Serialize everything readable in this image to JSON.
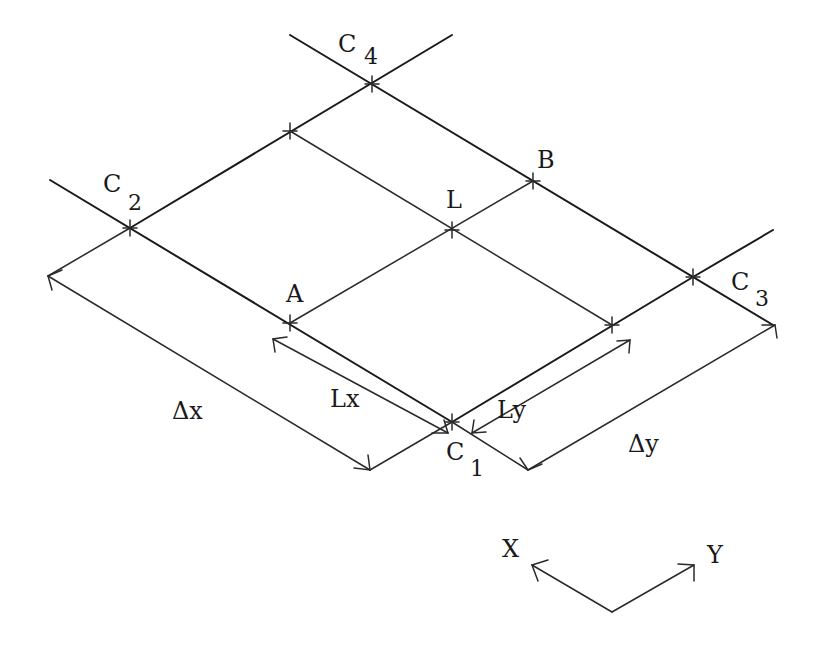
{
  "diagram": {
    "type": "isometric-grid-cell",
    "stroke_color": "#1a1a1a",
    "background": "#ffffff",
    "corners": [
      {
        "id": "C1",
        "label": "C",
        "subscript": "1",
        "x": 452,
        "y": 422
      },
      {
        "id": "C2",
        "label": "C",
        "subscript": "2",
        "x": 130,
        "y": 228
      },
      {
        "id": "C3",
        "label": "C",
        "subscript": "3",
        "x": 693,
        "y": 277
      },
      {
        "id": "C4",
        "label": "C",
        "subscript": "4",
        "x": 372,
        "y": 84
      }
    ],
    "points": [
      {
        "id": "A",
        "label": "A",
        "x": 290,
        "y": 323
      },
      {
        "id": "B",
        "label": "B",
        "x": 533,
        "y": 181
      },
      {
        "id": "L",
        "label": "L",
        "x": 452,
        "y": 230
      }
    ],
    "dimensions": [
      {
        "id": "dx",
        "label": "Δx"
      },
      {
        "id": "dy",
        "label": "Δy"
      },
      {
        "id": "Lx",
        "label": "Lx"
      },
      {
        "id": "Ly",
        "label": "Ly"
      }
    ],
    "axes": {
      "x_label": "X",
      "y_label": "Y"
    }
  }
}
